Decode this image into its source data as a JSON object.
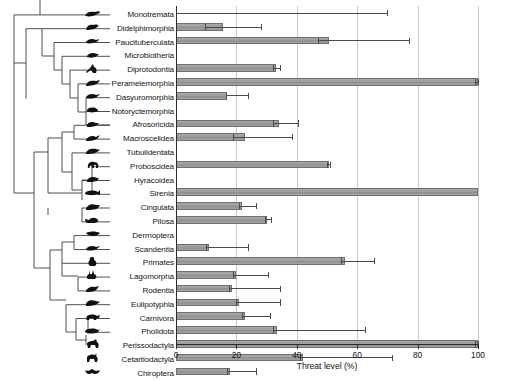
{
  "figure": {
    "type": "phylogeny-bar-chart",
    "background": "#ffffff",
    "bar_fill": "#9e9e9e",
    "bar_stroke": "#6f6f6f",
    "error_color": "#4a4a4a",
    "grid_color": "#c9c9c9",
    "axis_color": "#2b2b2b"
  },
  "chart_data": {
    "type": "bar",
    "orientation": "horizontal",
    "title": "",
    "xlabel": "Threat level (%)",
    "ylabel": "",
    "xlim": [
      0,
      100
    ],
    "xticks": [
      0,
      20,
      40,
      60,
      80,
      100
    ],
    "xticklabels": [
      "0",
      "20",
      "40",
      "60",
      "80",
      "100"
    ],
    "grid": "vertical",
    "legend": "none",
    "categories": [
      "Monotremata",
      "Didelphimorphia",
      "Paucituberculata",
      "Microbiotheria",
      "Diprotodontia",
      "Peramelemorphia",
      "Dasyuromorphia",
      "Notoryctemorphia",
      "Afrosoricida",
      "Macroscelidea",
      "Tubulidentata",
      "Proboscidea",
      "Hyracoidea",
      "Sirenia",
      "Cingulata",
      "Pilosa",
      "Dermoptera",
      "Scandentia",
      "Primates",
      "Lagomorpha",
      "Rodentia",
      "Eulipotyphla",
      "Carnivora",
      "Pholidota",
      "Perissodactyla",
      "Cetartiodactyla",
      "Chiroptera"
    ],
    "values": [
      0,
      15.5,
      50.5,
      0,
      33.0,
      100.0,
      17.0,
      0,
      34.0,
      23.0,
      0,
      50.5,
      0,
      100.0,
      22.0,
      30.0,
      0,
      11.0,
      56.0,
      20.0,
      18.5,
      21.0,
      23.0,
      33.5,
      100.0,
      42.0,
      18.0
    ],
    "error_low": [
      0,
      9.5,
      47.0,
      0,
      32.0,
      99.0,
      16.5,
      0,
      32.0,
      19.0,
      0,
      50.0,
      0,
      100.0,
      21.0,
      29.5,
      0,
      10.0,
      54.5,
      19.0,
      17.5,
      20.0,
      22.0,
      32.0,
      99.0,
      41.0,
      17.0
    ],
    "error_high": [
      70.0,
      28.0,
      77.0,
      0,
      34.5,
      100.0,
      24.0,
      0,
      40.5,
      38.5,
      0,
      51.0,
      0,
      100.0,
      26.5,
      31.5,
      0,
      24.0,
      65.5,
      30.5,
      34.5,
      34.5,
      31.0,
      62.5,
      100.0,
      71.5,
      26.5
    ]
  },
  "axis": {
    "title": "Threat level (%)",
    "ticks": [
      "0",
      "20",
      "40",
      "60",
      "80",
      "100"
    ]
  },
  "tree": {
    "description": "phylogenetic cladogram of mammalian orders",
    "tips": [
      {
        "label": "Monotremata",
        "icon": "platypus-icon"
      },
      {
        "label": "Didelphimorphia",
        "icon": "opossum-icon"
      },
      {
        "label": "Paucituberculata",
        "icon": "shrew-opossum-icon"
      },
      {
        "label": "Microbiotheria",
        "icon": "monito-del-monte-icon"
      },
      {
        "label": "Diprotodontia",
        "icon": "kangaroo-icon"
      },
      {
        "label": "Peramelemorphia",
        "icon": "bandicoot-icon"
      },
      {
        "label": "Dasyuromorphia",
        "icon": "quoll-icon"
      },
      {
        "label": "Notoryctemorphia",
        "icon": "marsupial-mole-icon"
      },
      {
        "label": "Afrosoricida",
        "icon": "tenrec-icon"
      },
      {
        "label": "Macroscelidea",
        "icon": "elephant-shrew-icon"
      },
      {
        "label": "Tubulidentata",
        "icon": "aardvark-icon"
      },
      {
        "label": "Proboscidea",
        "icon": "elephant-icon"
      },
      {
        "label": "Hyracoidea",
        "icon": "hyrax-icon"
      },
      {
        "label": "Sirenia",
        "icon": "manatee-icon"
      },
      {
        "label": "Cingulata",
        "icon": "armadillo-icon"
      },
      {
        "label": "Pilosa",
        "icon": "anteater-icon"
      },
      {
        "label": "Dermoptera",
        "icon": "colugo-icon"
      },
      {
        "label": "Scandentia",
        "icon": "treeshrew-icon"
      },
      {
        "label": "Primates",
        "icon": "primate-icon"
      },
      {
        "label": "Lagomorpha",
        "icon": "rabbit-icon"
      },
      {
        "label": "Rodentia",
        "icon": "rodent-icon"
      },
      {
        "label": "Eulipotyphla",
        "icon": "hedgehog-icon"
      },
      {
        "label": "Carnivora",
        "icon": "carnivore-icon"
      },
      {
        "label": "Pholidota",
        "icon": "pangolin-icon"
      },
      {
        "label": "Perissodactyla",
        "icon": "horse-icon"
      },
      {
        "label": "Cetartiodactyla",
        "icon": "deer-icon"
      },
      {
        "label": "Chiroptera",
        "icon": "bat-icon"
      }
    ]
  }
}
